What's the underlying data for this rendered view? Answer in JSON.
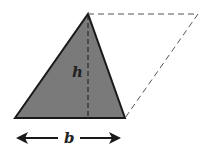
{
  "diagram": {
    "labels": {
      "height": "h",
      "base": "b"
    },
    "shapes": {
      "triangle": {
        "vertices": [
          [
            15,
            118
          ],
          [
            88,
            14
          ],
          [
            125,
            118
          ]
        ],
        "fill": "#7a7a7a",
        "stroke": "#1a1a1a"
      },
      "parallelogram_completion": {
        "points": [
          [
            88,
            14
          ],
          [
            198,
            14
          ],
          [
            125,
            118
          ]
        ],
        "style": "dashed"
      },
      "height_line": {
        "from": [
          88,
          14
        ],
        "to": [
          88,
          118
        ],
        "style": "dashed"
      },
      "base_arrow": {
        "from": [
          16,
          138
        ],
        "to": [
          121,
          138
        ],
        "style": "double-headed"
      }
    },
    "colors": {
      "fill": "#7a7a7a",
      "stroke": "#1a1a1a",
      "dash": "#555555"
    }
  }
}
